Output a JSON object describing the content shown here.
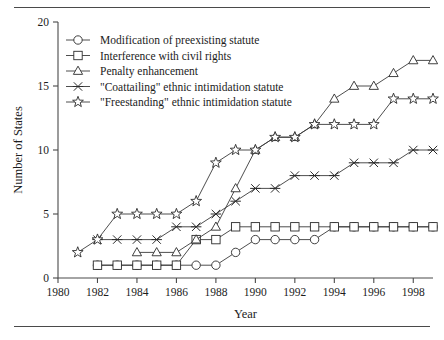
{
  "figure": {
    "has_top_rule": true,
    "has_bottom_rule": true,
    "rule_color": "#4a4a4a"
  },
  "chart_data": {
    "type": "line",
    "title": "",
    "xlabel": "Year",
    "ylabel": "Number of States",
    "xlim": [
      1980,
      1999
    ],
    "ylim": [
      0,
      20
    ],
    "xticks": [
      1980,
      1982,
      1984,
      1986,
      1988,
      1990,
      1992,
      1994,
      1996,
      1998
    ],
    "yticks": [
      0,
      5,
      10,
      15,
      20
    ],
    "xtick_labels": [
      "1980",
      "1982",
      "1984",
      "1986",
      "1988",
      "1990",
      "1992",
      "1994",
      "1996",
      "1998"
    ],
    "ytick_labels": [
      "0",
      "5",
      "10",
      "15",
      "20"
    ],
    "grid": false,
    "legend_position": "upper left",
    "line_color": "#3a3a3a",
    "marker_face_color": "#ffffff",
    "marker_edge_color": "#2b2b2b",
    "series": [
      {
        "name": "Modification of preexisting statute",
        "marker": "circle",
        "x": [
          1982,
          1983,
          1984,
          1985,
          1986,
          1987,
          1988,
          1989,
          1990,
          1991,
          1992,
          1993,
          1994,
          1995,
          1996,
          1997,
          1998,
          1999
        ],
        "values": [
          1,
          1,
          1,
          1,
          1,
          1,
          1,
          2,
          3,
          3,
          3,
          3,
          4,
          4,
          4,
          4,
          4,
          4
        ]
      },
      {
        "name": "Interference with civil rights",
        "marker": "square",
        "x": [
          1982,
          1983,
          1984,
          1985,
          1986,
          1987,
          1988,
          1989,
          1990,
          1991,
          1992,
          1993,
          1994,
          1995,
          1996,
          1997,
          1998,
          1999
        ],
        "values": [
          1,
          1,
          1,
          1,
          1,
          3,
          3,
          4,
          4,
          4,
          4,
          4,
          4,
          4,
          4,
          4,
          4,
          4
        ]
      },
      {
        "name": "Penalty enhancement",
        "marker": "triangle",
        "x": [
          1984,
          1985,
          1986,
          1987,
          1988,
          1989,
          1990,
          1991,
          1992,
          1993,
          1994,
          1995,
          1996,
          1997,
          1998,
          1999
        ],
        "values": [
          2,
          2,
          2,
          3,
          4,
          7,
          10,
          11,
          11,
          12,
          14,
          15,
          15,
          16,
          17,
          17
        ]
      },
      {
        "name": "\"Coattailing\" ethnic intimidation statute",
        "marker": "x",
        "x": [
          1982,
          1983,
          1984,
          1985,
          1986,
          1987,
          1988,
          1989,
          1990,
          1991,
          1992,
          1993,
          1994,
          1995,
          1996,
          1997,
          1998,
          1999
        ],
        "values": [
          3,
          3,
          3,
          3,
          4,
          4,
          5,
          6,
          7,
          7,
          8,
          8,
          8,
          9,
          9,
          9,
          10,
          10
        ]
      },
      {
        "name": "\"Freestanding\" ethnic intimidation statute",
        "marker": "star",
        "x": [
          1981,
          1982,
          1983,
          1984,
          1985,
          1986,
          1987,
          1988,
          1989,
          1990,
          1991,
          1992,
          1993,
          1994,
          1995,
          1996,
          1997,
          1998,
          1999
        ],
        "values": [
          2,
          3,
          5,
          5,
          5,
          5,
          6,
          9,
          10,
          10,
          11,
          11,
          12,
          12,
          12,
          12,
          14,
          14,
          14
        ]
      }
    ]
  },
  "legend": {
    "entries": [
      {
        "label": "Modification of preexisting statute",
        "marker": "circle"
      },
      {
        "label": "Interference with civil rights",
        "marker": "square"
      },
      {
        "label": "Penalty enhancement",
        "marker": "triangle"
      },
      {
        "label": "\"Coattailing\" ethnic intimidation statute",
        "marker": "x"
      },
      {
        "label": "\"Freestanding\" ethnic intimidation statute",
        "marker": "star"
      }
    ]
  }
}
